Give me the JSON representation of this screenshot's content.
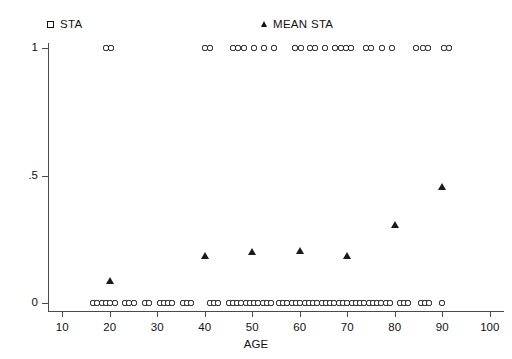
{
  "legend": {
    "entries": [
      {
        "label": "STA",
        "marker": "square-marker-icon",
        "x": 47,
        "y": 18
      },
      {
        "label": "MEAN STA",
        "marker": "triangle-marker-icon",
        "x": 261,
        "y": 18
      }
    ]
  },
  "chart_data": {
    "type": "scatter",
    "title": "",
    "xlabel": "AGE",
    "ylabel": "",
    "xlim": [
      7,
      103
    ],
    "ylim": [
      0,
      1
    ],
    "grid": false,
    "legend_position": "top",
    "xticks": [
      10,
      20,
      30,
      40,
      50,
      60,
      70,
      80,
      90,
      100
    ],
    "xtick_labels": [
      "10",
      "20",
      "30",
      "40",
      "50",
      "60",
      "70",
      "80",
      "90",
      "100"
    ],
    "yticks": [
      0,
      0.5,
      1
    ],
    "ytick_labels": [
      "0",
      ".5",
      "1"
    ],
    "series": [
      {
        "name": "STA",
        "marker": "square",
        "points": [
          [
            19.2,
            1
          ],
          [
            20.3,
            1
          ],
          [
            40.0,
            1
          ],
          [
            41.1,
            1
          ],
          [
            46.0,
            1
          ],
          [
            47.0,
            1
          ],
          [
            48.2,
            1
          ],
          [
            50.3,
            1
          ],
          [
            52.4,
            1
          ],
          [
            54.6,
            1
          ],
          [
            59.0,
            1
          ],
          [
            60.2,
            1
          ],
          [
            62.2,
            1
          ],
          [
            63.3,
            1
          ],
          [
            65.4,
            1
          ],
          [
            67.5,
            1
          ],
          [
            68.6,
            1
          ],
          [
            69.7,
            1
          ],
          [
            70.8,
            1
          ],
          [
            74.0,
            1
          ],
          [
            75.1,
            1
          ],
          [
            77.3,
            1
          ],
          [
            79.4,
            1
          ],
          [
            84.5,
            1
          ],
          [
            86.0,
            1
          ],
          [
            87.1,
            1
          ],
          [
            90.3,
            1
          ],
          [
            91.4,
            1
          ],
          [
            16.5,
            0
          ],
          [
            17.4,
            0
          ],
          [
            18.3,
            0
          ],
          [
            19.2,
            0
          ],
          [
            20.1,
            0
          ],
          [
            21.0,
            0
          ],
          [
            23.2,
            0
          ],
          [
            24.1,
            0
          ],
          [
            25.0,
            0
          ],
          [
            27.4,
            0
          ],
          [
            28.3,
            0
          ],
          [
            30.5,
            0
          ],
          [
            31.4,
            0
          ],
          [
            32.3,
            0
          ],
          [
            33.2,
            0
          ],
          [
            35.4,
            0
          ],
          [
            36.3,
            0
          ],
          [
            37.2,
            0
          ],
          [
            41.0,
            0
          ],
          [
            41.9,
            0
          ],
          [
            42.8,
            0
          ],
          [
            45.0,
            0
          ],
          [
            45.9,
            0
          ],
          [
            46.8,
            0
          ],
          [
            47.7,
            0
          ],
          [
            48.6,
            0
          ],
          [
            49.5,
            0
          ],
          [
            50.4,
            0
          ],
          [
            51.3,
            0
          ],
          [
            52.2,
            0
          ],
          [
            53.1,
            0
          ],
          [
            54.0,
            0
          ],
          [
            55.6,
            0
          ],
          [
            56.5,
            0
          ],
          [
            57.4,
            0
          ],
          [
            58.3,
            0
          ],
          [
            59.2,
            0
          ],
          [
            60.1,
            0
          ],
          [
            61.0,
            0
          ],
          [
            61.9,
            0
          ],
          [
            62.8,
            0
          ],
          [
            63.7,
            0
          ],
          [
            64.6,
            0
          ],
          [
            65.5,
            0
          ],
          [
            66.4,
            0
          ],
          [
            67.3,
            0
          ],
          [
            68.2,
            0
          ],
          [
            69.1,
            0
          ],
          [
            70.0,
            0
          ],
          [
            70.9,
            0
          ],
          [
            71.8,
            0
          ],
          [
            72.7,
            0
          ],
          [
            73.6,
            0
          ],
          [
            74.5,
            0
          ],
          [
            75.4,
            0
          ],
          [
            76.3,
            0
          ],
          [
            77.2,
            0
          ],
          [
            78.1,
            0
          ],
          [
            79.0,
            0
          ],
          [
            81.0,
            0
          ],
          [
            81.9,
            0
          ],
          [
            82.8,
            0
          ],
          [
            85.5,
            0
          ],
          [
            86.4,
            0
          ],
          [
            87.3,
            0
          ],
          [
            90.0,
            0
          ]
        ]
      },
      {
        "name": "MEAN STA",
        "marker": "triangle",
        "points": [
          [
            20,
            0.085
          ],
          [
            40,
            0.185
          ],
          [
            50,
            0.2
          ],
          [
            60,
            0.205
          ],
          [
            70,
            0.185
          ],
          [
            80,
            0.305
          ],
          [
            90,
            0.455
          ]
        ]
      }
    ]
  }
}
